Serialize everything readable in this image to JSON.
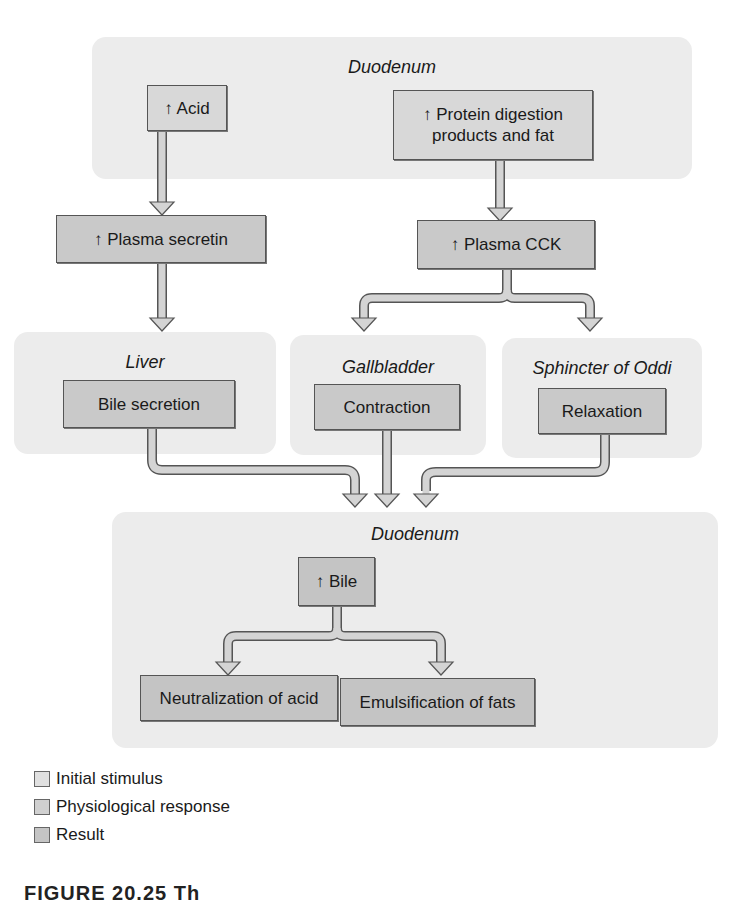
{
  "diagram": {
    "regions": {
      "duodenum_top": "Duodenum",
      "liver": "Liver",
      "gallbladder": "Gallbladder",
      "sphincter": "Sphincter of Oddi",
      "duodenum_bottom": "Duodenum"
    },
    "boxes": {
      "acid": "↑ Acid",
      "protein": "↑ Protein digestion products and fat",
      "protein_line1": "↑ Protein digestion",
      "protein_line2": "products and fat",
      "secretin": "↑ Plasma secretin",
      "cck": "↑ Plasma CCK",
      "bile_secretion": "Bile secretion",
      "contraction": "Contraction",
      "relaxation": "Relaxation",
      "bile": "↑ Bile",
      "neutralization": "Neutralization of acid",
      "emulsification": "Emulsification of fats"
    },
    "flows": [
      {
        "from": "↑ Acid",
        "to": "↑ Plasma secretin"
      },
      {
        "from": "↑ Protein digestion products and fat",
        "to": "↑ Plasma CCK"
      },
      {
        "from": "↑ Plasma secretin",
        "to": "Bile secretion"
      },
      {
        "from": "↑ Plasma CCK",
        "to": "Contraction"
      },
      {
        "from": "↑ Plasma CCK",
        "to": "Relaxation"
      },
      {
        "from": "Bile secretion",
        "to": "↑ Bile"
      },
      {
        "from": "Contraction",
        "to": "↑ Bile"
      },
      {
        "from": "Relaxation",
        "to": "↑ Bile"
      },
      {
        "from": "↑ Bile",
        "to": "Neutralization of acid"
      },
      {
        "from": "↑ Bile",
        "to": "Emulsification of fats"
      }
    ]
  },
  "legend": {
    "items": [
      {
        "label": "Initial stimulus",
        "color": "#e0e0e0"
      },
      {
        "label": "Physiological response",
        "color": "#d0d0d0"
      },
      {
        "label": "Result",
        "color": "#c4c4c4"
      }
    ]
  },
  "caption": "FIGURE 20.25 Th"
}
